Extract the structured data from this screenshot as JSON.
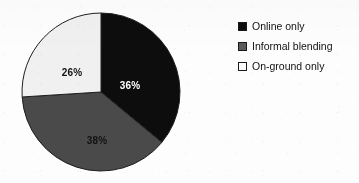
{
  "chart_data": {
    "type": "pie",
    "title": "",
    "categories": [
      "Online only",
      "Informal blending",
      "On-ground only"
    ],
    "values": [
      36,
      38,
      26
    ],
    "value_labels": [
      "36%",
      "38%",
      "26%"
    ],
    "unit": "percent",
    "start_angle_deg": 0,
    "direction": "clockwise",
    "legend_position": "right",
    "grid": false,
    "colors": [
      "#0d0d0d",
      "#4a4a4a",
      "#f0f0f0"
    ],
    "outline_color": "#1f1f1f",
    "slices": [
      {
        "name": "Online only",
        "value": 36,
        "label": "36%",
        "color": "#0d0d0d",
        "label_color": "#fefefe",
        "label_x": 130,
        "label_y": 85
      },
      {
        "name": "Informal blending",
        "value": 38,
        "label": "38%",
        "color": "#4a4a4a",
        "label_color": "#121212",
        "label_x": 97,
        "label_y": 140
      },
      {
        "name": "On-ground only",
        "value": 26,
        "label": "26%",
        "color": "#f0f0f0",
        "label_color": "#121212",
        "label_x": 72,
        "label_y": 72
      }
    ],
    "geometry": {
      "center_x": 101,
      "center_y": 92,
      "radius": 79
    }
  },
  "legend": {
    "items": [
      {
        "label": "Online only",
        "swatch": "#0d0d0d"
      },
      {
        "label": "Informal blending",
        "swatch": "#5a5a5a"
      },
      {
        "label": "On-ground only",
        "swatch": "#fbfbfb"
      }
    ]
  }
}
